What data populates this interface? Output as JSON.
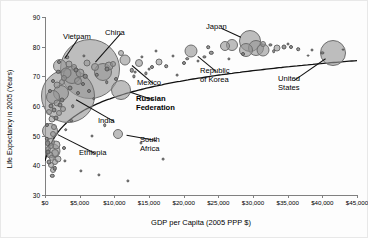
{
  "chart_data": {
    "type": "scatter",
    "title": "",
    "xlabel": "GDP per Capita (2005 PPP $)",
    "ylabel": "Life Expectancy in 2005 (Years)",
    "xlim": [
      0,
      45000
    ],
    "ylim": [
      30,
      90
    ],
    "xticks": [
      "$0",
      "$5,000",
      "$10,000",
      "$15,000",
      "$20,000",
      "$25,000",
      "$30,000",
      "$35,000",
      "$40,000",
      "$45,000"
    ],
    "xtick_values": [
      0,
      5000,
      10000,
      15000,
      20000,
      25000,
      30000,
      35000,
      40000,
      45000
    ],
    "yticks": [
      "30",
      "40",
      "50",
      "60",
      "70",
      "80",
      "90"
    ],
    "ytick_values": [
      30,
      40,
      50,
      60,
      70,
      80,
      90
    ],
    "grid": false,
    "legend": "none",
    "bubble_meaning": "population",
    "trendline": "logarithmic fit rising steeply below $10,000 then flattening near 80 years",
    "annotations": [
      {
        "name": "Vietnam",
        "x": 2200,
        "y": 73.5,
        "label_x": 62,
        "label_y": 32
      },
      {
        "name": "China",
        "x": 6500,
        "y": 72.5,
        "label_x": 104,
        "label_y": 28
      },
      {
        "name": "India",
        "x": 3300,
        "y": 63.5,
        "label_x": 97,
        "label_y": 116
      },
      {
        "name": "Mexico",
        "x": 11500,
        "y": 75.5,
        "label_x": 136,
        "label_y": 78
      },
      {
        "name": "Russian Federation",
        "x": 11000,
        "y": 65.5,
        "label_x": 135,
        "label_y": 94,
        "bold": true
      },
      {
        "name": "Ethiopia",
        "x": 700,
        "y": 51.5,
        "label_x": 78,
        "label_y": 148
      },
      {
        "name": "South Africa",
        "x": 10500,
        "y": 50.5,
        "label_x": 139,
        "label_y": 135
      },
      {
        "name": "Japan",
        "x": 29500,
        "y": 82.0,
        "label_x": 205,
        "label_y": 22
      },
      {
        "name": "Republic of Korea",
        "x": 21000,
        "y": 78.5,
        "label_x": 199,
        "label_y": 66
      },
      {
        "name": "United States",
        "x": 41500,
        "y": 77.8,
        "label_x": 277,
        "label_y": 74
      }
    ],
    "points": [
      {
        "x": 6500,
        "y": 72.5,
        "r": 30.0,
        "name": "China"
      },
      {
        "x": 3300,
        "y": 63.5,
        "r": 27.0,
        "name": "India"
      },
      {
        "x": 41500,
        "y": 77.8,
        "r": 13.0,
        "name": "United States"
      },
      {
        "x": 2200,
        "y": 73.5,
        "r": 7.0,
        "name": "Vietnam"
      },
      {
        "x": 11000,
        "y": 65.5,
        "r": 10.0,
        "name": "Russian Federation"
      },
      {
        "x": 29500,
        "y": 82.0,
        "r": 11.0,
        "name": "Japan"
      },
      {
        "x": 21000,
        "y": 78.5,
        "r": 6.5,
        "name": "Republic of Korea"
      },
      {
        "x": 11500,
        "y": 75.5,
        "r": 5.5,
        "name": "Mexico"
      },
      {
        "x": 10500,
        "y": 50.5,
        "r": 5.0,
        "name": "South Africa"
      },
      {
        "x": 700,
        "y": 51.5,
        "r": 8.0,
        "name": "Ethiopia"
      },
      {
        "x": 1200,
        "y": 45.0,
        "r": 7.5,
        "name": "Nigeria"
      },
      {
        "x": 3900,
        "y": 70.5,
        "r": 9.0,
        "name": "Indonesia"
      },
      {
        "x": 2300,
        "y": 64.5,
        "r": 8.0,
        "name": "Pakistan"
      },
      {
        "x": 1100,
        "y": 63.0,
        "r": 7.0,
        "name": "Bangladesh"
      },
      {
        "x": 8300,
        "y": 71.5,
        "r": 9.0,
        "name": "Brazil"
      },
      {
        "x": 3100,
        "y": 71.0,
        "r": 5.5,
        "name": "Philippines"
      },
      {
        "x": 5000,
        "y": 71.0,
        "r": 4.5,
        "name": "Egypt"
      },
      {
        "x": 4700,
        "y": 68.5,
        "r": 4.0,
        "name": "Iran"
      },
      {
        "x": 7200,
        "y": 73.0,
        "r": 4.0,
        "name": "Thailand"
      },
      {
        "x": 9300,
        "y": 73.5,
        "r": 4.5,
        "name": "Turkey"
      },
      {
        "x": 13500,
        "y": 74.5,
        "r": 4.0,
        "name": "Poland"
      },
      {
        "x": 16500,
        "y": 75.0,
        "r": 3.5,
        "name": "Czech Republic"
      },
      {
        "x": 30500,
        "y": 79.5,
        "r": 8.0,
        "name": "Germany"
      },
      {
        "x": 29000,
        "y": 79.0,
        "r": 7.0,
        "name": "France"
      },
      {
        "x": 31500,
        "y": 79.0,
        "r": 6.5,
        "name": "United Kingdom"
      },
      {
        "x": 27000,
        "y": 80.5,
        "r": 6.0,
        "name": "Italy"
      },
      {
        "x": 26000,
        "y": 80.2,
        "r": 5.0,
        "name": "Spain"
      },
      {
        "x": 33500,
        "y": 79.5,
        "r": 3.5,
        "name": "Canada"
      },
      {
        "x": 31500,
        "y": 81.0,
        "r": 3.0,
        "name": "Australia"
      },
      {
        "x": 34500,
        "y": 79.8,
        "r": 2.5,
        "name": "Netherlands"
      },
      {
        "x": 24000,
        "y": 78.0,
        "r": 2.2,
        "name": "Greece"
      },
      {
        "x": 35500,
        "y": 80.0,
        "r": 2.0,
        "name": "Switzerland"
      },
      {
        "x": 36500,
        "y": 79.2,
        "r": 1.8,
        "name": "Austria"
      },
      {
        "x": 33000,
        "y": 78.5,
        "r": 1.8,
        "name": "Belgium"
      },
      {
        "x": 32500,
        "y": 80.5,
        "r": 1.6,
        "name": "Sweden"
      },
      {
        "x": 38500,
        "y": 79.0,
        "r": 1.5,
        "name": "Ireland"
      },
      {
        "x": 23500,
        "y": 79.8,
        "r": 1.8,
        "name": "Portugal"
      },
      {
        "x": 40000,
        "y": 78.0,
        "r": 1.6,
        "name": "Norway"
      },
      {
        "x": 1600,
        "y": 47.0,
        "r": 4.5,
        "name": "DR Congo"
      },
      {
        "x": 900,
        "y": 48.0,
        "r": 4.0,
        "name": "Tanzania"
      },
      {
        "x": 1400,
        "y": 44.0,
        "r": 4.0,
        "name": "Kenya"
      },
      {
        "x": 1900,
        "y": 42.0,
        "r": 3.5,
        "name": "Uganda"
      },
      {
        "x": 800,
        "y": 40.0,
        "r": 3.0,
        "name": "Mozambique"
      },
      {
        "x": 1100,
        "y": 38.5,
        "r": 3.0,
        "name": "Zambia"
      },
      {
        "x": 1500,
        "y": 41.0,
        "r": 3.0,
        "name": "Sudan"
      },
      {
        "x": 700,
        "y": 43.5,
        "r": 3.5,
        "name": "Malawi"
      },
      {
        "x": 1000,
        "y": 55.5,
        "r": 3.5,
        "name": "Ghana"
      },
      {
        "x": 2000,
        "y": 57.5,
        "r": 3.0,
        "name": "Cameroon"
      },
      {
        "x": 1300,
        "y": 53.0,
        "r": 3.0,
        "name": "Senegal"
      },
      {
        "x": 2600,
        "y": 59.0,
        "r": 3.0,
        "name": "Morocco"
      },
      {
        "x": 1800,
        "y": 67.0,
        "r": 3.5,
        "name": "Myanmar"
      },
      {
        "x": 2500,
        "y": 68.0,
        "r": 3.0,
        "name": "Sri Lanka"
      },
      {
        "x": 1700,
        "y": 61.0,
        "r": 3.5,
        "name": "Nepal"
      },
      {
        "x": 900,
        "y": 60.0,
        "r": 2.5,
        "name": "Cambodia"
      },
      {
        "x": 3500,
        "y": 74.0,
        "r": 3.5,
        "name": "Algeria"
      },
      {
        "x": 6000,
        "y": 74.5,
        "r": 3.5,
        "name": "Colombia"
      },
      {
        "x": 4200,
        "y": 73.0,
        "r": 3.0,
        "name": "Peru"
      },
      {
        "x": 9800,
        "y": 74.0,
        "r": 3.0,
        "name": "Argentina"
      },
      {
        "x": 11000,
        "y": 78.0,
        "r": 3.0,
        "name": "Chile"
      },
      {
        "x": 9000,
        "y": 72.5,
        "r": 2.5,
        "name": "Malaysia"
      },
      {
        "x": 12500,
        "y": 72.0,
        "r": 2.2,
        "name": "Venezuela"
      },
      {
        "x": 7500,
        "y": 70.5,
        "r": 2.2,
        "name": "Ukraine"
      },
      {
        "x": 5500,
        "y": 67.5,
        "r": 2.0,
        "name": "Uzbekistan"
      },
      {
        "x": 4800,
        "y": 64.5,
        "r": 2.0,
        "name": "Kazakhstan"
      },
      {
        "x": 15500,
        "y": 73.0,
        "r": 2.0,
        "name": "Hungary"
      },
      {
        "x": 17500,
        "y": 73.5,
        "r": 1.8,
        "name": "Slovakia"
      },
      {
        "x": 20500,
        "y": 76.0,
        "r": 1.8,
        "name": "Slovenia"
      },
      {
        "x": 12000,
        "y": 34.8,
        "r": 1.6,
        "name": "Botswana"
      },
      {
        "x": 7800,
        "y": 36.8,
        "r": 1.6,
        "name": "Swaziland"
      },
      {
        "x": 5200,
        "y": 38.0,
        "r": 1.6,
        "name": "Namibia"
      },
      {
        "x": 8600,
        "y": 53.5,
        "r": 1.8,
        "name": "Gabon"
      },
      {
        "x": 2900,
        "y": 41.5,
        "r": 1.6,
        "name": "Angola"
      },
      {
        "x": 13800,
        "y": 47.5,
        "r": 1.5,
        "name": "Equatorial Guinea"
      },
      {
        "x": 17000,
        "y": 42.0,
        "r": 1.4,
        "name": "Gulf outlier"
      },
      {
        "x": 6800,
        "y": 50.0,
        "r": 1.5,
        "name": "Congo Rep"
      },
      {
        "x": 3000,
        "y": 52.0,
        "r": 1.8,
        "name": "Nigeria-alt"
      },
      {
        "x": 20000,
        "y": 74.5,
        "r": 2.0,
        "name": "Saudi Arabia"
      },
      {
        "x": 23000,
        "y": 76.5,
        "r": 1.6,
        "name": "Israel"
      },
      {
        "x": 26500,
        "y": 76.0,
        "r": 1.6,
        "name": "Cyprus"
      },
      {
        "x": 38000,
        "y": 77.0,
        "r": 1.4,
        "name": "Kuwait"
      },
      {
        "x": 43000,
        "y": 79.0,
        "r": 1.4,
        "name": "Luxembourg"
      },
      {
        "x": 28500,
        "y": 77.5,
        "r": 2.0,
        "name": "New Zealand"
      },
      {
        "x": 35000,
        "y": 81.0,
        "r": 1.5,
        "name": "Iceland"
      },
      {
        "x": 2800,
        "y": 69.5,
        "r": 3.0,
        "name": "Bolivia"
      },
      {
        "x": 600,
        "y": 58.0,
        "r": 3.0,
        "name": "Madagascar"
      },
      {
        "x": 500,
        "y": 45.5,
        "r": 3.0,
        "name": "Niger"
      },
      {
        "x": 400,
        "y": 47.5,
        "r": 2.8,
        "name": "Burundi"
      },
      {
        "x": 1200,
        "y": 50.5,
        "r": 3.0,
        "name": "Rwanda"
      },
      {
        "x": 1600,
        "y": 56.0,
        "r": 2.5,
        "name": "Cote d'Ivoire"
      },
      {
        "x": 950,
        "y": 42.5,
        "r": 3.2,
        "name": "Burkina Faso"
      },
      {
        "x": 850,
        "y": 46.5,
        "r": 3.0,
        "name": "Mali"
      },
      {
        "x": 1300,
        "y": 58.5,
        "r": 2.5,
        "name": "Yemen"
      },
      {
        "x": 2100,
        "y": 60.5,
        "r": 2.5,
        "name": "Guatemala"
      },
      {
        "x": 550,
        "y": 41.0,
        "r": 2.5,
        "name": "Sierra Leone"
      },
      {
        "x": 450,
        "y": 44.5,
        "r": 2.5,
        "name": "Liberia"
      },
      {
        "x": 1050,
        "y": 36.5,
        "r": 2.2,
        "name": "Zimbabwe"
      },
      {
        "x": 1450,
        "y": 39.0,
        "r": 2.2,
        "name": "Lesotho"
      },
      {
        "x": 3600,
        "y": 66.0,
        "r": 2.5,
        "name": "Honduras"
      },
      {
        "x": 4400,
        "y": 72.0,
        "r": 2.5,
        "name": "Ecuador"
      },
      {
        "x": 2400,
        "y": 62.0,
        "r": 2.5,
        "name": "Lao PDR"
      },
      {
        "x": 1900,
        "y": 71.5,
        "r": 2.2,
        "name": "Nicaragua"
      },
      {
        "x": 5800,
        "y": 70.0,
        "r": 2.2,
        "name": "Tunisia"
      },
      {
        "x": 6300,
        "y": 65.0,
        "r": 2.0,
        "name": "Turkmenistan"
      },
      {
        "x": 2700,
        "y": 46.0,
        "r": 2.0,
        "name": "Djibouti"
      },
      {
        "x": 3800,
        "y": 55.0,
        "r": 1.8,
        "name": "Papua New Guinea"
      },
      {
        "x": 7000,
        "y": 62.5,
        "r": 1.8,
        "name": "Azerbaijan"
      },
      {
        "x": 4000,
        "y": 60.0,
        "r": 1.8,
        "name": "Mongolia"
      },
      {
        "x": 300,
        "y": 49.0,
        "r": 2.2,
        "name": "Guinea-Bissau"
      },
      {
        "x": 350,
        "y": 53.5,
        "r": 2.0,
        "name": "Eritrea"
      },
      {
        "x": 10200,
        "y": 69.0,
        "r": 2.0,
        "name": "Romania"
      },
      {
        "x": 8900,
        "y": 68.0,
        "r": 1.8,
        "name": "Bulgaria"
      },
      {
        "x": 14500,
        "y": 71.0,
        "r": 1.6,
        "name": "Croatia"
      },
      {
        "x": 12800,
        "y": 70.0,
        "r": 1.6,
        "name": "Belarus"
      },
      {
        "x": 14000,
        "y": 76.5,
        "r": 1.6,
        "name": "Costa Rica"
      },
      {
        "x": 18500,
        "y": 77.0,
        "r": 1.5,
        "name": "Bahrain"
      },
      {
        "x": 22000,
        "y": 75.2,
        "r": 1.5,
        "name": "Oman"
      },
      {
        "x": 16000,
        "y": 78.5,
        "r": 1.5,
        "name": "Malta"
      },
      {
        "x": 650,
        "y": 65.0,
        "r": 2.0,
        "name": "Tajikistan"
      },
      {
        "x": 1150,
        "y": 68.5,
        "r": 2.0,
        "name": "Kyrgyzstan"
      },
      {
        "x": 2000,
        "y": 75.0,
        "r": 2.0,
        "name": "Albania"
      },
      {
        "x": 3200,
        "y": 76.5,
        "r": 1.8,
        "name": "Armenia"
      },
      {
        "x": 5600,
        "y": 77.0,
        "r": 1.6,
        "name": "Cuba-like"
      },
      {
        "x": 19000,
        "y": 70.5,
        "r": 1.4,
        "name": "Estonia"
      },
      {
        "x": 13000,
        "y": 71.5,
        "r": 1.4,
        "name": "Latvia"
      },
      {
        "x": 15000,
        "y": 72.5,
        "r": 1.4,
        "name": "Lithuania"
      }
    ]
  }
}
